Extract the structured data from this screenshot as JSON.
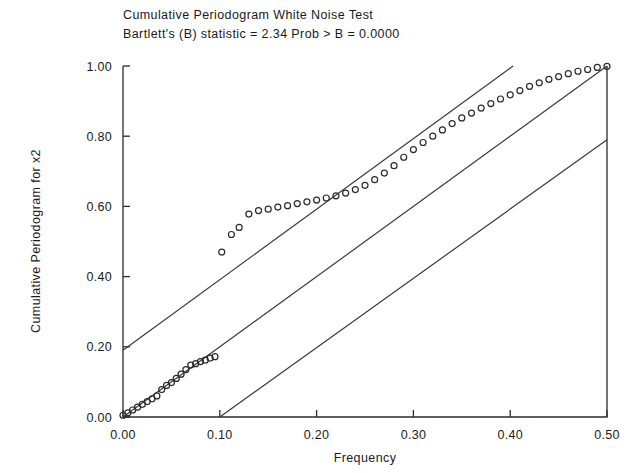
{
  "chart_data": {
    "type": "scatter",
    "title": "Cumulative Periodogram White Noise Test",
    "subtitle": "Bartlett's (B) statistic =      2.34   Prob > B = 0.0000",
    "statistic_label": "Bartlett's (B) statistic =",
    "statistic_value": "2.34",
    "prob_label": "Prob > B =",
    "prob_value": "0.0000",
    "xlabel": "Frequency",
    "ylabel": "Cumulative Periodogram for x2",
    "xlim": [
      0.0,
      0.5
    ],
    "ylim": [
      0.0,
      1.0
    ],
    "grid": false,
    "legend": "none",
    "xticks": [
      0.0,
      0.1,
      0.2,
      0.3,
      0.4,
      0.5
    ],
    "xticklabels": [
      "0.00",
      "0.10",
      "0.20",
      "0.30",
      "0.40",
      "0.50"
    ],
    "yticks": [
      0.0,
      0.2,
      0.4,
      0.6,
      0.8,
      1.0
    ],
    "yticklabels": [
      "0.00",
      "0.20",
      "0.40",
      "0.60",
      "0.80",
      "1.00"
    ],
    "series": [
      {
        "name": "Cumulative periodogram",
        "marker": "open-circle",
        "x": [
          0.0,
          0.005,
          0.01,
          0.015,
          0.02,
          0.025,
          0.03,
          0.035,
          0.04,
          0.045,
          0.05,
          0.055,
          0.06,
          0.065,
          0.07,
          0.075,
          0.08,
          0.085,
          0.09,
          0.095,
          0.102,
          0.112,
          0.12,
          0.13,
          0.14,
          0.15,
          0.16,
          0.17,
          0.18,
          0.19,
          0.2,
          0.21,
          0.22,
          0.23,
          0.24,
          0.25,
          0.26,
          0.27,
          0.28,
          0.29,
          0.3,
          0.31,
          0.32,
          0.33,
          0.34,
          0.35,
          0.36,
          0.37,
          0.38,
          0.39,
          0.4,
          0.41,
          0.42,
          0.43,
          0.44,
          0.45,
          0.46,
          0.47,
          0.48,
          0.49,
          0.5
        ],
        "y": [
          0.005,
          0.012,
          0.02,
          0.028,
          0.036,
          0.044,
          0.052,
          0.06,
          0.078,
          0.09,
          0.098,
          0.11,
          0.122,
          0.135,
          0.148,
          0.152,
          0.158,
          0.162,
          0.168,
          0.172,
          0.47,
          0.52,
          0.54,
          0.578,
          0.588,
          0.592,
          0.598,
          0.602,
          0.608,
          0.613,
          0.618,
          0.624,
          0.63,
          0.638,
          0.648,
          0.66,
          0.676,
          0.695,
          0.716,
          0.74,
          0.762,
          0.782,
          0.8,
          0.818,
          0.836,
          0.852,
          0.866,
          0.88,
          0.893,
          0.906,
          0.918,
          0.93,
          0.942,
          0.952,
          0.962,
          0.97,
          0.978,
          0.985,
          0.99,
          0.996,
          0.999
        ]
      }
    ],
    "reference_lines": [
      {
        "name": "upper-confidence-band",
        "x": [
          0.0,
          0.403
        ],
        "y": [
          0.19,
          1.0
        ]
      },
      {
        "name": "diagonal-reference-line",
        "x": [
          0.0,
          0.5
        ],
        "y": [
          0.0,
          1.0
        ]
      },
      {
        "name": "lower-confidence-band",
        "x": [
          0.1,
          0.5
        ],
        "y": [
          0.0,
          0.79
        ]
      }
    ],
    "colors": {
      "axis": "#2b2b2b",
      "marker": "#2b2b2b",
      "band": "#3a3a3a",
      "background": "#ffffff"
    }
  }
}
